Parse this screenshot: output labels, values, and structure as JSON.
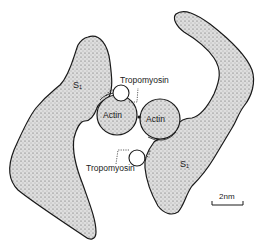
{
  "diagram": {
    "labels": {
      "s1_left": "S₁",
      "s1_right": "S₁",
      "actin_left": "Actin",
      "actin_right": "Actin",
      "tropomyosin_top": "Tropomyosin",
      "tropomyosin_bottom": "Tropomyosin",
      "scale": "2nm"
    },
    "colors": {
      "outline": "#1a1a1a",
      "fill": "#d9d9d9",
      "background": "#ffffff"
    }
  }
}
